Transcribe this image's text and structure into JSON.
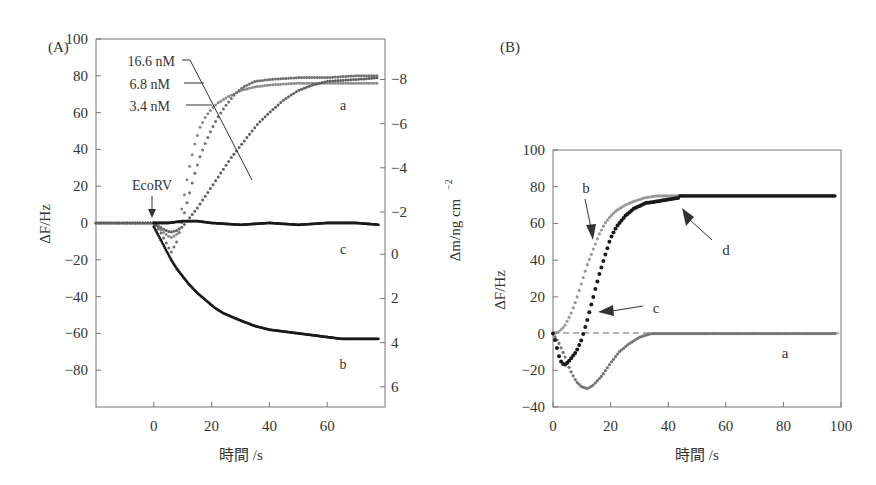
{
  "chart_data": [
    {
      "panel": "(A)",
      "type": "scatter",
      "xlabel": "時間 /s",
      "ylabel": "ΔF/Hz",
      "y2label": "Δm/ng cm⁻²",
      "xlim": [
        -20,
        80
      ],
      "ylim": [
        -100,
        100
      ],
      "xticks": [
        0,
        20,
        40,
        60
      ],
      "yticks": [
        100,
        80,
        60,
        40,
        20,
        0,
        -20,
        -40,
        -60,
        -80
      ],
      "y2ticks": [
        {
          "label": "−8",
          "at_hz": 78
        },
        {
          "label": "−6",
          "at_hz": 54
        },
        {
          "label": "−4",
          "at_hz": 30
        },
        {
          "label": "−2",
          "at_hz": 6
        },
        {
          "label": "0",
          "at_hz": -17
        },
        {
          "label": "2",
          "at_hz": -41
        },
        {
          "label": "4",
          "at_hz": -65
        },
        {
          "label": "6",
          "at_hz": -89
        }
      ],
      "annotations": [
        "EcoRV",
        "16.6 nM",
        "6.8 nM",
        "3.4 nM",
        "a",
        "b",
        "c"
      ],
      "series": [
        {
          "name": "a: 16.6 nM",
          "color": "#8a8a8a",
          "x": [
            -20,
            -10,
            0,
            2,
            4,
            6,
            8,
            10,
            12,
            14,
            16,
            18,
            20,
            22,
            25,
            30,
            35,
            40,
            50,
            60,
            70,
            78
          ],
          "y": [
            0,
            0,
            0,
            -3,
            -6,
            -8,
            -6,
            10,
            28,
            42,
            52,
            58,
            62,
            65,
            68,
            72,
            74,
            75,
            76,
            76,
            76,
            76
          ]
        },
        {
          "name": "a: 6.8 nM",
          "color": "#707070",
          "x": [
            -20,
            -10,
            0,
            2,
            4,
            6,
            8,
            10,
            12,
            14,
            16,
            18,
            20,
            22,
            25,
            28,
            31,
            35,
            40,
            50,
            60,
            70,
            78
          ],
          "y": [
            0,
            0,
            0,
            -4,
            -10,
            -16,
            -10,
            2,
            14,
            26,
            36,
            44,
            51,
            57,
            64,
            70,
            74,
            77,
            78,
            79,
            79,
            80,
            80
          ]
        },
        {
          "name": "a: 3.4 nM",
          "color": "#606060",
          "x": [
            -20,
            -10,
            0,
            2,
            4,
            6,
            8,
            10,
            12,
            15,
            18,
            21,
            24,
            27,
            30,
            33,
            36,
            40,
            45,
            50,
            55,
            60,
            70,
            78
          ],
          "y": [
            0,
            0,
            0,
            -2,
            -4,
            -5,
            -4,
            -2,
            2,
            8,
            15,
            22,
            29,
            36,
            42,
            48,
            54,
            60,
            67,
            72,
            75,
            77,
            78,
            79
          ]
        },
        {
          "name": "b",
          "color": "#1a1a1a",
          "x": [
            0,
            2,
            4,
            6,
            8,
            10,
            12,
            15,
            18,
            21,
            24,
            27,
            30,
            35,
            40,
            45,
            50,
            55,
            60,
            65,
            70,
            75,
            78
          ],
          "y": [
            -2,
            -8,
            -14,
            -20,
            -25,
            -29,
            -33,
            -38,
            -42,
            -46,
            -49,
            -51,
            -53,
            -56,
            -58,
            -59,
            -60,
            -61,
            -62,
            -63,
            -63,
            -63,
            -63
          ]
        },
        {
          "name": "c",
          "color": "#1a1a1a",
          "x": [
            0,
            5,
            10,
            15,
            20,
            30,
            40,
            50,
            60,
            70,
            78
          ],
          "y": [
            0,
            0,
            1,
            1,
            0,
            -1,
            0,
            -1,
            0,
            0,
            -1
          ]
        }
      ]
    },
    {
      "panel": "(B)",
      "type": "scatter",
      "xlabel": "時間 /s",
      "ylabel": "ΔF/Hz",
      "xlim": [
        0,
        100
      ],
      "ylim": [
        -40,
        100
      ],
      "xticks": [
        0,
        20,
        40,
        60,
        80,
        100
      ],
      "yticks": [
        100,
        80,
        60,
        40,
        20,
        0,
        -20,
        -40
      ],
      "annotations": [
        "a",
        "b",
        "c",
        "d"
      ],
      "reference_line": {
        "y": 0,
        "style": "dashed"
      },
      "series": [
        {
          "name": "a",
          "color": "#777777",
          "x": [
            0,
            2,
            4,
            6,
            8,
            10,
            12,
            14,
            17,
            20,
            23,
            26,
            30,
            34,
            40,
            50,
            60,
            70,
            80,
            90,
            98
          ],
          "y": [
            0,
            -5,
            -12,
            -20,
            -26,
            -29,
            -30,
            -28,
            -23,
            -16,
            -10,
            -6,
            -2,
            0,
            0,
            0,
            0,
            0,
            0,
            0,
            0
          ]
        },
        {
          "name": "b",
          "color": "#999999",
          "x": [
            0,
            2,
            4,
            6,
            8,
            10,
            12,
            14,
            16,
            18,
            20,
            22,
            25,
            28,
            32,
            36,
            40,
            45
          ],
          "y": [
            0,
            1,
            4,
            10,
            18,
            28,
            38,
            46,
            54,
            60,
            64,
            67,
            70,
            72,
            74,
            75,
            75,
            75
          ]
        },
        {
          "name": "c",
          "color": "#1a1a1a",
          "x": [
            0,
            1,
            2,
            3,
            4,
            5,
            6,
            8,
            10,
            12,
            14,
            16,
            18,
            20,
            22,
            25,
            28,
            32,
            36,
            40,
            44
          ],
          "y": [
            0,
            -5,
            -12,
            -16,
            -17,
            -16,
            -14,
            -10,
            -3,
            8,
            20,
            32,
            42,
            52,
            58,
            64,
            68,
            71,
            72,
            73,
            74
          ]
        },
        {
          "name": "d",
          "color": "#1a1a1a",
          "x": [
            44,
            50,
            60,
            70,
            80,
            90,
            98
          ],
          "y": [
            75,
            75,
            75,
            75,
            75,
            75,
            75
          ]
        }
      ]
    }
  ],
  "labels": {
    "panel_a": "(A)",
    "panel_b": "(B)",
    "a_xlabel": "時間 /s",
    "a_ylabel": "ΔF/Hz",
    "a_y2label_main": "Δm/ng cm",
    "a_y2label_sup": "−2",
    "b_xlabel": "時間 /s",
    "b_ylabel": "ΔF/Hz",
    "ecorv": "EcoRV",
    "conc1": "16.6 nM",
    "conc2": "6.8 nM",
    "conc3": "3.4 nM",
    "a_curve_a": "a",
    "a_curve_b": "b",
    "a_curve_c": "c",
    "b_curve_a": "a",
    "b_curve_b": "b",
    "b_curve_c": "c",
    "b_curve_d": "d"
  }
}
